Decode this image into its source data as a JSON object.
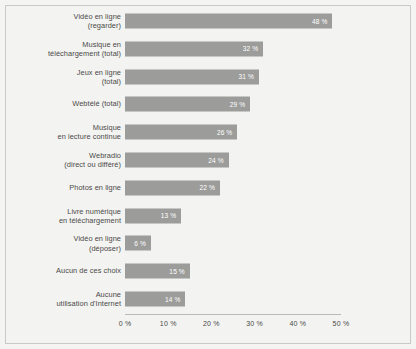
{
  "chart_data": {
    "type": "bar",
    "orientation": "horizontal",
    "title": "",
    "subtitle": "",
    "xlabel": "",
    "ylabel": "",
    "xlim": [
      0,
      55
    ],
    "grid": false,
    "legend": null,
    "xticks": [
      "0 %",
      "10 %",
      "20 %",
      "30 %",
      "40 %",
      "50 %"
    ],
    "xtick_values": [
      0,
      10,
      20,
      30,
      40,
      50
    ],
    "categories": [
      "Vidéo en ligne\n(regarder)",
      "Musique en\ntéléchargement (total)",
      "Jeux en ligne\n(total)",
      "Webtélé (total)",
      "Musique\nen lecture continue",
      "Webradio\n(direct ou différé)",
      "Photos en ligne",
      "Livre numérique\nen téléchargement",
      "Vidéo en ligne\n(déposer)",
      "Aucun de ces choix",
      "Aucune\nutilisation d'Internet"
    ],
    "values": [
      48,
      32,
      31,
      29,
      26,
      24,
      22,
      13,
      6,
      15,
      14
    ],
    "value_labels": [
      "48 %",
      "32 %",
      "31 %",
      "29 %",
      "26 %",
      "24 %",
      "22 %",
      "13 %",
      "6 %",
      "15 %",
      "14 %"
    ],
    "bar_color": "#9c9c9a",
    "value_label_color": "#ffffff",
    "background_color": "#f3f3f1",
    "border_color": "#c9c9c6",
    "text_color": "#4a4a48"
  },
  "rows": [
    {
      "label_line1": "Vidéo en ligne",
      "label_line2": "(regarder)",
      "value": 48,
      "value_label": "48 %"
    },
    {
      "label_line1": "Musique en",
      "label_line2": "téléchargement (total)",
      "value": 32,
      "value_label": "32 %"
    },
    {
      "label_line1": "Jeux en ligne",
      "label_line2": "(total)",
      "value": 31,
      "value_label": "31 %"
    },
    {
      "label_line1": "Webtélé (total)",
      "label_line2": "",
      "value": 29,
      "value_label": "29 %"
    },
    {
      "label_line1": "Musique",
      "label_line2": "en lecture continue",
      "value": 26,
      "value_label": "26 %"
    },
    {
      "label_line1": "Webradio",
      "label_line2": "(direct ou différé)",
      "value": 24,
      "value_label": "24 %"
    },
    {
      "label_line1": "Photos en ligne",
      "label_line2": "",
      "value": 22,
      "value_label": "22 %"
    },
    {
      "label_line1": "Livre numérique",
      "label_line2": "en téléchargement",
      "value": 13,
      "value_label": "13 %"
    },
    {
      "label_line1": "Vidéo en ligne",
      "label_line2": "(déposer)",
      "value": 6,
      "value_label": "6 %"
    },
    {
      "label_line1": "Aucun de ces choix",
      "label_line2": "",
      "value": 15,
      "value_label": "15 %"
    },
    {
      "label_line1": "Aucune",
      "label_line2": "utilisation d'Internet",
      "value": 14,
      "value_label": "14 %"
    }
  ],
  "axis": {
    "ticks": [
      "0 %",
      "10 %",
      "20 %",
      "30 %",
      "40 %",
      "50 %"
    ]
  }
}
